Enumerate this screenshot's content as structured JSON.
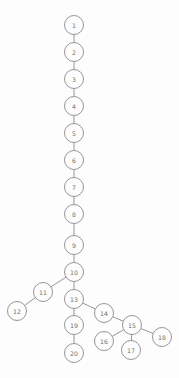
{
  "diagram": {
    "type": "tree",
    "background_color": "#fdfdfd",
    "node_fill_color": "#fdfdfd",
    "node_stroke_color": "#8a8a8a",
    "edge_color": "#8a8a8a",
    "label_color": "#6e6e6e",
    "node_radius": 9.5,
    "nodes": [
      {
        "id": "1",
        "label": "1",
        "x": 74,
        "y": 25
      },
      {
        "id": "2",
        "label": "2",
        "x": 74,
        "y": 52
      },
      {
        "id": "3",
        "label": "3",
        "x": 74,
        "y": 79
      },
      {
        "id": "4",
        "label": "4",
        "x": 74,
        "y": 106
      },
      {
        "id": "5",
        "label": "5",
        "x": 74,
        "y": 133
      },
      {
        "id": "6",
        "label": "6",
        "x": 74,
        "y": 160
      },
      {
        "id": "7",
        "label": "7",
        "x": 74,
        "y": 187
      },
      {
        "id": "8",
        "label": "8",
        "x": 74,
        "y": 214
      },
      {
        "id": "9",
        "label": "9",
        "x": 74,
        "y": 245
      },
      {
        "id": "10",
        "label": "10",
        "x": 74,
        "y": 272
      },
      {
        "id": "11",
        "label": "11",
        "x": 43,
        "y": 292
      },
      {
        "id": "12",
        "label": "12",
        "x": 17,
        "y": 311
      },
      {
        "id": "13",
        "label": "13",
        "x": 74,
        "y": 299
      },
      {
        "id": "14",
        "label": "14",
        "x": 104,
        "y": 313
      },
      {
        "id": "15",
        "label": "15",
        "x": 132,
        "y": 325
      },
      {
        "id": "16",
        "label": "16",
        "x": 104,
        "y": 341
      },
      {
        "id": "17",
        "label": "17",
        "x": 131,
        "y": 350
      },
      {
        "id": "18",
        "label": "18",
        "x": 162,
        "y": 337
      },
      {
        "id": "19",
        "label": "19",
        "x": 74,
        "y": 325
      },
      {
        "id": "20",
        "label": "20",
        "x": 74,
        "y": 353
      }
    ],
    "edges": [
      {
        "from": "1",
        "to": "2"
      },
      {
        "from": "2",
        "to": "3"
      },
      {
        "from": "3",
        "to": "4"
      },
      {
        "from": "4",
        "to": "5"
      },
      {
        "from": "5",
        "to": "6"
      },
      {
        "from": "6",
        "to": "7"
      },
      {
        "from": "7",
        "to": "8"
      },
      {
        "from": "8",
        "to": "9"
      },
      {
        "from": "9",
        "to": "10"
      },
      {
        "from": "10",
        "to": "11"
      },
      {
        "from": "10",
        "to": "13"
      },
      {
        "from": "11",
        "to": "12"
      },
      {
        "from": "13",
        "to": "14"
      },
      {
        "from": "13",
        "to": "19"
      },
      {
        "from": "14",
        "to": "15"
      },
      {
        "from": "15",
        "to": "16"
      },
      {
        "from": "15",
        "to": "17"
      },
      {
        "from": "15",
        "to": "18"
      },
      {
        "from": "19",
        "to": "20"
      }
    ]
  }
}
